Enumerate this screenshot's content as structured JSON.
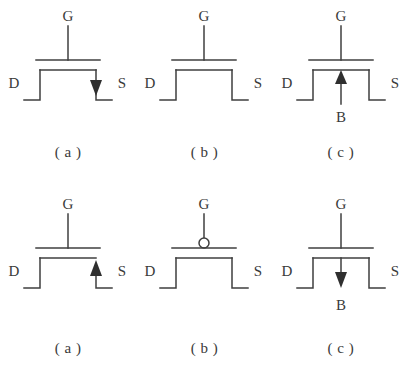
{
  "figure": {
    "background_color": "#ffffff",
    "line_color": "#3f3f3f",
    "text_color": "#3a3a3a",
    "rows": [
      {
        "row_name": "top-row",
        "symbols": [
          {
            "id": "top-a",
            "caption": "( a )",
            "gate_label": "G",
            "drain_label": "D",
            "source_label": "S",
            "bulk_label": "",
            "gate_bubble": false,
            "arrow": "down",
            "arrow_location": "source-lead",
            "description": "n-channel MOSFET symbol, arrow on source pointing down"
          },
          {
            "id": "top-b",
            "caption": "( b )",
            "gate_label": "G",
            "drain_label": "D",
            "source_label": "S",
            "bulk_label": "",
            "gate_bubble": false,
            "arrow": "none",
            "arrow_location": "",
            "description": "MOSFET symbol without arrow"
          },
          {
            "id": "top-c",
            "caption": "( c )",
            "gate_label": "G",
            "drain_label": "D",
            "source_label": "S",
            "bulk_label": "B",
            "gate_bubble": false,
            "arrow": "up",
            "arrow_location": "bulk-lead",
            "description": "n-channel MOSFET with bulk terminal B, arrow pointing up into channel"
          }
        ]
      },
      {
        "row_name": "bottom-row",
        "symbols": [
          {
            "id": "bottom-a",
            "caption": "( a )",
            "gate_label": "G",
            "drain_label": "D",
            "source_label": "S",
            "bulk_label": "",
            "gate_bubble": false,
            "arrow": "up",
            "arrow_location": "source-lead",
            "description": "p-channel MOSFET symbol, arrow on source pointing up"
          },
          {
            "id": "bottom-b",
            "caption": "( b )",
            "gate_label": "G",
            "drain_label": "D",
            "source_label": "S",
            "bulk_label": "",
            "gate_bubble": true,
            "arrow": "none",
            "arrow_location": "",
            "description": "p-channel MOSFET symbol with inversion bubble on gate"
          },
          {
            "id": "bottom-c",
            "caption": "( c )",
            "gate_label": "G",
            "drain_label": "D",
            "source_label": "S",
            "bulk_label": "B",
            "gate_bubble": false,
            "arrow": "down",
            "arrow_location": "bulk-lead",
            "description": "p-channel MOSFET with bulk terminal B, arrow pointing down out of channel"
          }
        ]
      }
    ]
  }
}
